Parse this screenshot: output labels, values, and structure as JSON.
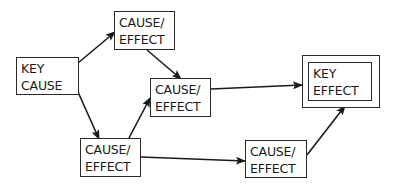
{
  "diagram": {
    "type": "cause-effect flow diagram",
    "nodes": [
      {
        "id": "key-cause",
        "line1": "KEY",
        "line2": "CAUSE",
        "x": 16,
        "y": 57,
        "w": 63,
        "h": 38
      },
      {
        "id": "ce-top",
        "line1": "CAUSE/",
        "line2": "EFFECT",
        "x": 114,
        "y": 11,
        "w": 61,
        "h": 39
      },
      {
        "id": "ce-middle",
        "line1": "CAUSE/",
        "line2": "EFFECT",
        "x": 150,
        "y": 78,
        "w": 61,
        "h": 39
      },
      {
        "id": "ce-bottom-left",
        "line1": "CAUSE/",
        "line2": "EFFECT",
        "x": 80,
        "y": 138,
        "w": 61,
        "h": 39
      },
      {
        "id": "ce-bottom-right",
        "line1": "CAUSE/",
        "line2": "EFFECT",
        "x": 245,
        "y": 140,
        "w": 62,
        "h": 38
      },
      {
        "id": "key-effect",
        "line1": "KEY",
        "line2": "EFFECT",
        "x": 308,
        "y": 62,
        "w": 64,
        "h": 39,
        "double_border": true
      }
    ],
    "edges": [
      {
        "from": "key-cause",
        "to": "ce-top"
      },
      {
        "from": "ce-top",
        "to": "ce-middle"
      },
      {
        "from": "key-cause",
        "to": "ce-bottom-left"
      },
      {
        "from": "ce-bottom-left",
        "to": "ce-middle"
      },
      {
        "from": "ce-middle",
        "to": "key-effect"
      },
      {
        "from": "ce-bottom-left",
        "to": "ce-bottom-right"
      },
      {
        "from": "ce-bottom-right",
        "to": "key-effect"
      }
    ],
    "colors": {
      "line": "#1a1a1a",
      "background": "#ffffff"
    }
  }
}
